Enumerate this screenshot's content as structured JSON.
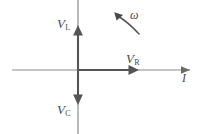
{
  "figure": {
    "type": "phasor-diagram",
    "title": "",
    "background_color": "#ffffff",
    "stroke_color": "#555555",
    "label_color": "#4a4a4a",
    "width": 202,
    "height": 134
  },
  "axes": {
    "vertical": {
      "name": "voltage-axis",
      "x": 78,
      "y_top": 0,
      "y_bottom": 134
    },
    "horizontal": {
      "name": "current-axis",
      "y": 70,
      "x_left": 12,
      "x_right": 190,
      "arrow_at": "right"
    },
    "origin": {
      "x": 78,
      "y": 70
    }
  },
  "labels": {
    "vl": {
      "symbol": "V",
      "subscript": "L",
      "meaning": "inductor-voltage"
    },
    "vc": {
      "symbol": "V",
      "subscript": "C",
      "meaning": "capacitor-voltage"
    },
    "vr": {
      "symbol": "V",
      "subscript": "R",
      "meaning": "resistor-voltage"
    },
    "omega": {
      "symbol": "ω",
      "meaning": "angular-frequency"
    },
    "current": {
      "symbol": "I",
      "meaning": "current"
    }
  },
  "phasors": [
    {
      "name": "vl-phasor",
      "label": "V_L",
      "direction": "up",
      "angle_deg": 90,
      "length_px": 42,
      "from": {
        "x": 78,
        "y": 70
      },
      "to": {
        "x": 78,
        "y": 28
      }
    },
    {
      "name": "vc-phasor",
      "label": "V_C",
      "direction": "down",
      "angle_deg": -90,
      "length_px": 32,
      "from": {
        "x": 78,
        "y": 70
      },
      "to": {
        "x": 78,
        "y": 102
      }
    },
    {
      "name": "vr-phasor",
      "label": "V_R",
      "direction": "right",
      "angle_deg": 0,
      "length_px": 59,
      "from": {
        "x": 78,
        "y": 70
      },
      "to": {
        "x": 137,
        "y": 70
      }
    }
  ],
  "rotation_indicator": {
    "name": "omega-arc",
    "label": "ω",
    "direction": "counterclockwise",
    "arrow_tip": {
      "x": 115,
      "y": 13
    },
    "tail": {
      "x": 139,
      "y": 34
    }
  }
}
